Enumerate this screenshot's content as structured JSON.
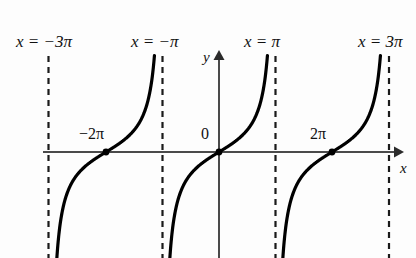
{
  "figure": {
    "background_color": "#fdfdfd",
    "curve_color": "#000000",
    "axis_color": "#3a3a3a",
    "asymptote_color": "#1a1a1a"
  },
  "axes": {
    "x_axis_label": "x",
    "y_axis_label": "y",
    "origin_label": "0"
  },
  "asymptote_labels": [
    {
      "id": "asym-neg-3pi",
      "text": "x = −3π",
      "x_value": -3
    },
    {
      "id": "asym-neg-pi",
      "text": "x = −π",
      "x_value": -1
    },
    {
      "id": "asym-pos-pi",
      "text": "x = π",
      "x_value": 1
    },
    {
      "id": "asym-pos-3pi",
      "text": "x = 3π",
      "x_value": 3
    }
  ],
  "tick_labels": [
    {
      "id": "tick-neg-2pi",
      "text": "−2π"
    },
    {
      "id": "tick-zero",
      "text": "0"
    },
    {
      "id": "tick-pos-2pi",
      "text": "2π"
    }
  ],
  "chart_data": {
    "type": "line",
    "title": "",
    "xlabel": "x",
    "ylabel": "y",
    "function": "y = tan(x/2)",
    "period_in_pi": 2,
    "grid": false,
    "legend": null,
    "xlim_pi": [
      -3.6,
      3.6
    ],
    "ylim": [
      -6,
      6
    ],
    "x_zero_crossings_pi": [
      -2,
      0,
      2
    ],
    "asymptotes_pi": [
      -3,
      -1,
      1,
      3
    ],
    "asymptote_label_texts": [
      "x = −3π",
      "x = −π",
      "x = π",
      "x = 3π"
    ],
    "tick_label_texts": [
      "−2π",
      "0",
      "2π"
    ],
    "marked_points_pi": [
      -2,
      0,
      2
    ],
    "branches": [
      {
        "name": "branch -3pi..-1pi",
        "asymptote_left_pi": -3,
        "asymptote_right_pi": -1,
        "zero_pi": -2
      },
      {
        "name": "branch -1pi..1pi",
        "asymptote_left_pi": -1,
        "asymptote_right_pi": 1,
        "zero_pi": 0
      },
      {
        "name": "branch 1pi..3pi",
        "asymptote_left_pi": 1,
        "asymptote_right_pi": 3,
        "zero_pi": 2
      }
    ]
  },
  "geometry": {
    "px_per_pi": 56.5,
    "origin_px": {
      "x": 219,
      "y": 152
    },
    "asymptote_px_x": [
      48.5,
      162.5,
      275.5,
      389
    ],
    "x_axis_start_px": 43,
    "x_axis_arrow_px": 401,
    "y_axis_arrow_top_px": 52,
    "curve_top_px": 57,
    "curve_bottom_px": 258
  }
}
